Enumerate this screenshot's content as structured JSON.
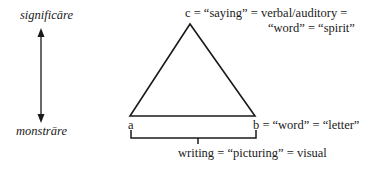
{
  "axis": {
    "top_label": "significāre",
    "bottom_label": "monstrāre"
  },
  "triangle": {
    "apex_label_line1": "c = “saying” = verbal/auditory =",
    "apex_label_line2": "“word” = “spirit”",
    "left_vertex_label": "a",
    "right_vertex_label": "b = “word” = “letter”",
    "base_caption": "writing = “picturing” = visual"
  }
}
